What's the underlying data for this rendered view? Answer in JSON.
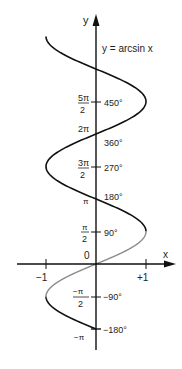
{
  "chart_data": {
    "type": "line",
    "title": "y = arcsin x",
    "xlabel": "x",
    "ylabel": "y",
    "xlim": [
      -1,
      1
    ],
    "ylim": [
      -3.14159,
      10.9956
    ],
    "grid": false,
    "x_ticks": [
      {
        "value": -1,
        "label": "−1"
      },
      {
        "value": 1,
        "label": "+1"
      }
    ],
    "origin_label": "0",
    "y_ticks": [
      {
        "value_rad": 7.85398,
        "radian_num": "5π",
        "radian_den": "2",
        "degree": "450°"
      },
      {
        "value_rad": 6.28319,
        "radian_label": "2π",
        "degree": "360°"
      },
      {
        "value_rad": 4.71239,
        "radian_num": "3π",
        "radian_den": "2",
        "degree": "270°"
      },
      {
        "value_rad": 3.14159,
        "radian_label": "π",
        "degree": "180°"
      },
      {
        "value_rad": 1.5708,
        "radian_num": "π",
        "radian_den": "2",
        "degree": "90°"
      },
      {
        "value_rad": -1.5708,
        "radian_num": "−π",
        "radian_den": "2",
        "degree": "−90°"
      },
      {
        "value_rad": -3.14159,
        "radian_label": "−π",
        "degree": "−180°"
      }
    ],
    "series": [
      {
        "name": "principal branch",
        "color": "#888888",
        "y_range_rad": [
          -1.5708,
          1.5708
        ]
      },
      {
        "name": "multivalued extension",
        "color": "#111111",
        "y_range_rad": [
          -3.14159,
          10.9956
        ]
      }
    ],
    "annotations": [
      "y = arcsin x"
    ]
  },
  "labels": {
    "title": "y = arcsin x",
    "x_axis": "x",
    "y_axis": "y",
    "origin": "0",
    "x_neg1": "−1",
    "x_pos1": "+1",
    "t_5pi2_num": "5π",
    "t_5pi2_den": "2",
    "t_5pi2_deg": "450°",
    "t_2pi": "2π",
    "t_2pi_deg": "360°",
    "t_3pi2_num": "3π",
    "t_3pi2_den": "2",
    "t_3pi2_deg": "270°",
    "t_pi": "π",
    "t_pi_deg": "180°",
    "t_pi2_num": "π",
    "t_pi2_den": "2",
    "t_pi2_deg": "90°",
    "t_npi2_num": "−π",
    "t_npi2_den": "2",
    "t_npi2_deg": "−90°",
    "t_npi": "−π",
    "t_npi_deg": "−180°"
  },
  "colors": {
    "principal": "#8a8a8a",
    "extension": "#111111",
    "axis": "#111111"
  }
}
